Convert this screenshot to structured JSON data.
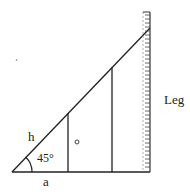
{
  "diagram": {
    "labels": {
      "hypotenuse": "h",
      "angle": "45°",
      "base": "a",
      "leg": "Leg"
    },
    "angle_degrees": 45,
    "colors": {
      "line": "#222222",
      "background": "#ffffff",
      "ruler_tick": "#444444"
    }
  }
}
